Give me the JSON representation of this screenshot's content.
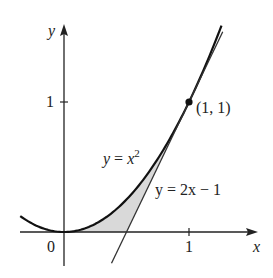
{
  "chart_data": {
    "type": "line",
    "title": "",
    "xlabel": "x",
    "ylabel": "y",
    "xlim": [
      -0.35,
      1.5
    ],
    "ylim": [
      -0.25,
      1.55
    ],
    "grid": false,
    "x_ticks": [
      {
        "value": 1,
        "label": "1"
      }
    ],
    "y_ticks": [
      {
        "value": 1,
        "label": "1"
      }
    ],
    "origin_label": "0",
    "series": [
      {
        "name": "y = x^2",
        "label": "y = x²",
        "function": "x^2",
        "domain": [
          -0.35,
          1.26
        ],
        "color": "#111111"
      },
      {
        "name": "y = 2x - 1",
        "label": "y = 2x − 1",
        "function": "2*x - 1",
        "domain": [
          0.38,
          1.27
        ],
        "color": "#333333"
      }
    ],
    "shaded_region": {
      "description": "Region bounded by y = x², the tangent line y = 2x − 1, and the x-axis",
      "from_x": 0,
      "to_x": 1,
      "color": "#d9d9d9"
    },
    "annotations": [
      {
        "type": "point",
        "x": 1,
        "y": 1,
        "label": "(1, 1)"
      }
    ]
  },
  "labels": {
    "x_axis": "x",
    "y_axis": "y",
    "origin": "0",
    "x_tick_1": "1",
    "y_tick_1": "1",
    "point": "(1, 1)",
    "curve_y": "y = x",
    "curve_sup": "2",
    "line": "y = 2x − 1"
  }
}
